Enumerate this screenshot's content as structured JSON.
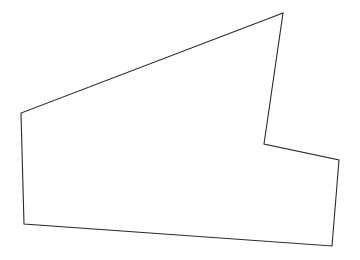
{
  "canvas": {
    "width": 360,
    "height": 260,
    "background_color": "#ffffff",
    "title": "Polygon Outline"
  },
  "shape": {
    "name": "irregular-concave-polygon",
    "type": "polygon",
    "vertex_count": 6,
    "stroke_color": "#2b2b2b",
    "fill_color": "#ffffff",
    "stroke_width": 1.1,
    "closed": true,
    "points_string": "283,13 21,113 24,224 332,246 339,160 264,144",
    "vertices": [
      {
        "label": "apex-top",
        "x": 283,
        "y": 13,
        "convex": true
      },
      {
        "label": "upper-left",
        "x": 21,
        "y": 113,
        "convex": true
      },
      {
        "label": "lower-left",
        "x": 24,
        "y": 224,
        "convex": true
      },
      {
        "label": "lower-right",
        "x": 332,
        "y": 246,
        "convex": true
      },
      {
        "label": "right-upper",
        "x": 339,
        "y": 160,
        "convex": true
      },
      {
        "label": "notch-reflex",
        "x": 264,
        "y": 144,
        "convex": false
      }
    ],
    "edges": [
      {
        "label": "long-diagonal-top",
        "from": "apex-top",
        "to": "upper-left"
      },
      {
        "label": "left-vertical",
        "from": "upper-left",
        "to": "lower-left"
      },
      {
        "label": "bottom-edge",
        "from": "lower-left",
        "to": "lower-right"
      },
      {
        "label": "right-edge",
        "from": "lower-right",
        "to": "right-upper"
      },
      {
        "label": "notch-lower-edge",
        "from": "right-upper",
        "to": "notch-reflex"
      },
      {
        "label": "notch-upper-edge",
        "from": "notch-reflex",
        "to": "apex-top"
      }
    ]
  }
}
